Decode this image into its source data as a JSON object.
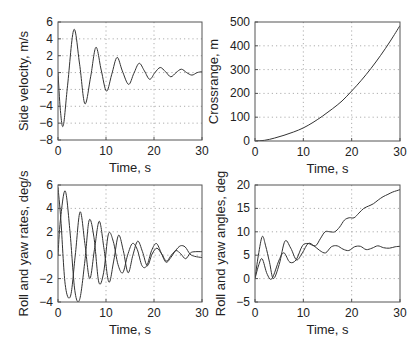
{
  "chart_data": [
    {
      "id": "side_velocity",
      "type": "line",
      "title": "",
      "xlabel": "Time, s",
      "ylabel": "Side velocity, m/s",
      "xlim": [
        0,
        30
      ],
      "ylim": [
        -8,
        6
      ],
      "xticks": [
        0,
        10,
        20,
        30
      ],
      "yticks": [
        -8,
        -6,
        -4,
        -2,
        0,
        2,
        4,
        6
      ],
      "grid": true,
      "box": [
        58,
        22,
        202,
        140
      ],
      "series": [
        {
          "name": "side velocity",
          "x": [
            0,
            0.5,
            1.1,
            2.0,
            3.3,
            4.5,
            5.6,
            6.8,
            7.9,
            9.0,
            10.1,
            11.2,
            12.3,
            13.4,
            14.7,
            15.8,
            16.9,
            18.0,
            19.1,
            20.2,
            21.3,
            22.4,
            23.5,
            24.6,
            25.7,
            26.8,
            27.9,
            29.0,
            30
          ],
          "y": [
            0,
            -4.5,
            -6.3,
            -1.5,
            5.1,
            1.0,
            -3.7,
            -0.5,
            3.0,
            0.3,
            -2.2,
            -0.2,
            1.8,
            0.2,
            -1.4,
            -0.1,
            1.1,
            0.2,
            -0.8,
            0.0,
            0.6,
            0.1,
            -0.5,
            0.0,
            0.4,
            0.0,
            -0.3,
            0.0,
            0.1
          ]
        }
      ]
    },
    {
      "id": "crossrange",
      "type": "line",
      "title": "",
      "xlabel": "Time, s",
      "ylabel": "Crossrange, m",
      "xlim": [
        0,
        30
      ],
      "ylim": [
        0,
        500
      ],
      "xticks": [
        0,
        10,
        20,
        30
      ],
      "yticks": [
        0,
        100,
        200,
        300,
        400,
        500
      ],
      "grid": true,
      "box": [
        255,
        22,
        400,
        141
      ],
      "series": [
        {
          "name": "crossrange",
          "x": [
            0,
            2,
            4,
            6,
            8,
            10,
            12,
            14,
            16,
            18,
            20,
            22,
            24,
            26,
            28,
            30
          ],
          "y": [
            0,
            3,
            12,
            24,
            38,
            55,
            78,
            105,
            135,
            168,
            210,
            255,
            305,
            360,
            420,
            485
          ]
        }
      ]
    },
    {
      "id": "roll_yaw_rates",
      "type": "line",
      "title": "",
      "xlabel": "Time, s",
      "ylabel": "Roll and yaw rates, deg/s",
      "xlim": [
        0,
        30
      ],
      "ylim": [
        -4,
        6
      ],
      "xticks": [
        0,
        10,
        20,
        30
      ],
      "yticks": [
        -4,
        -2,
        0,
        2,
        4,
        6
      ],
      "grid": true,
      "box": [
        58,
        185,
        202,
        302
      ],
      "series": [
        {
          "name": "roll rate",
          "x": [
            0,
            0.6,
            1.5,
            2.6,
            3.6,
            4.6,
            5.6,
            6.6,
            7.6,
            8.6,
            9.6,
            10.6,
            11.6,
            12.6,
            13.6,
            14.6,
            15.6,
            16.6,
            17.6,
            18.6,
            19.6,
            20.6,
            21.6,
            22.6,
            23.6,
            24.6,
            25.6,
            26.6,
            27.6,
            28.6,
            30
          ],
          "y": [
            5.8,
            3.0,
            -2.5,
            -3.5,
            0.0,
            3.7,
            1.0,
            -2.0,
            0.5,
            2.9,
            0.5,
            -2.3,
            -0.5,
            1.7,
            0.4,
            -1.5,
            0.0,
            1.2,
            0.3,
            -0.9,
            0.1,
            0.6,
            0.1,
            -0.5,
            0.0,
            0.4,
            0.1,
            -0.3,
            0.2,
            0.3,
            0.3
          ]
        },
        {
          "name": "yaw rate",
          "x": [
            0,
            0.5,
            1.5,
            2.5,
            3.5,
            4.5,
            5.6,
            6.5,
            7.5,
            8.5,
            9.5,
            10.5,
            11.5,
            12.5,
            13.5,
            14.5,
            15.5,
            16.5,
            17.5,
            18.5,
            19.5,
            20.5,
            21.5,
            22.5,
            23.5,
            24.5,
            25.5,
            26.5,
            27.5,
            28.5,
            30
          ],
          "y": [
            0,
            3.0,
            5.5,
            2.0,
            -3.0,
            -3.8,
            -0.5,
            3.0,
            1.5,
            -2.3,
            -1.5,
            1.8,
            1.2,
            -0.8,
            -1.5,
            0.0,
            1.0,
            0.5,
            -0.9,
            -0.9,
            0.4,
            1.0,
            0.2,
            -0.6,
            -0.2,
            0.4,
            0.8,
            0.7,
            0.1,
            -0.1,
            -0.2
          ]
        }
      ]
    },
    {
      "id": "roll_yaw_angles",
      "type": "line",
      "title": "",
      "xlabel": "Time, s",
      "ylabel": "Roll and yaw angles, deg",
      "xlim": [
        0,
        30
      ],
      "ylim": [
        -5,
        20
      ],
      "xticks": [
        0,
        10,
        20,
        30
      ],
      "yticks": [
        -5,
        0,
        5,
        10,
        15,
        20
      ],
      "grid": true,
      "box": [
        255,
        185,
        400,
        302
      ],
      "series": [
        {
          "name": "roll angle",
          "x": [
            0,
            0.7,
            1.5,
            2.2,
            3.0,
            3.8,
            5.0,
            6.2,
            7.4,
            8.6,
            9.8,
            11.0,
            12.2,
            13.4,
            14.6,
            15.8,
            17.0,
            18.2,
            19.4,
            20.6,
            21.8,
            23.0,
            24.2,
            25.4,
            26.6,
            27.8,
            29.0,
            30
          ],
          "y": [
            0,
            5.0,
            9.0,
            7.0,
            3.5,
            0.0,
            3.0,
            8.0,
            6.5,
            4.0,
            5.5,
            7.5,
            7.0,
            6.0,
            5.5,
            6.8,
            7.0,
            6.3,
            6.0,
            6.8,
            6.9,
            6.2,
            6.5,
            7.0,
            6.6,
            6.5,
            6.8,
            6.9
          ]
        },
        {
          "name": "yaw angle",
          "x": [
            0,
            0.8,
            1.5,
            2.5,
            3.5,
            5.0,
            6.0,
            7.2,
            8.5,
            9.8,
            11.0,
            12.5,
            13.5,
            14.5,
            15.5,
            16.5,
            17.5,
            18.5,
            19.5,
            20.5,
            21.5,
            22.5,
            23.5,
            24.5,
            25.5,
            26.5,
            27.5,
            28.5,
            30
          ],
          "y": [
            0,
            3.0,
            4.2,
            1.0,
            0.0,
            4.0,
            5.5,
            3.5,
            4.0,
            7.0,
            7.5,
            7.0,
            8.5,
            10.0,
            10.0,
            10.0,
            11.0,
            12.5,
            13.0,
            13.0,
            14.0,
            15.0,
            15.5,
            16.0,
            16.8,
            17.5,
            18.0,
            18.5,
            19.0
          ]
        }
      ]
    }
  ]
}
